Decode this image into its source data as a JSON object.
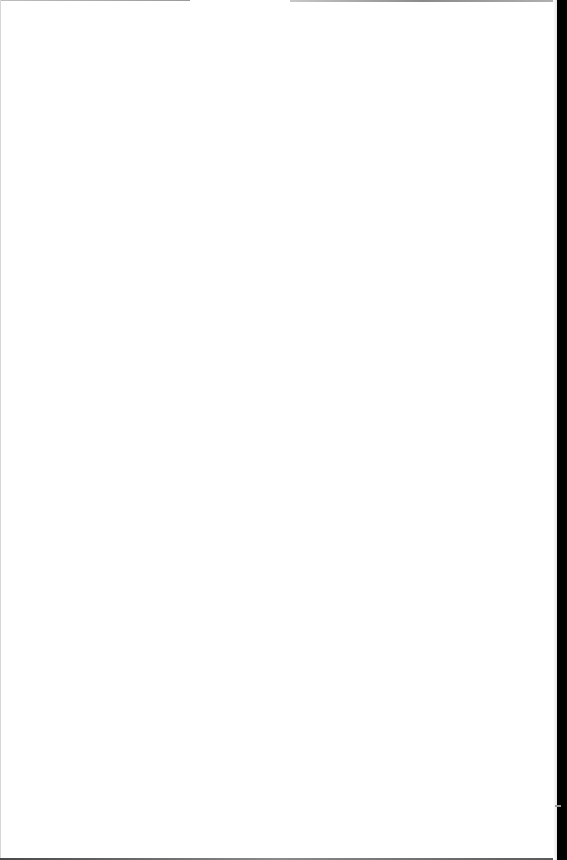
{
  "document": {
    "type": "blank-scanned-page",
    "text": "",
    "colors": {
      "paper": "#ffffff",
      "scan_border": "#000000"
    }
  }
}
